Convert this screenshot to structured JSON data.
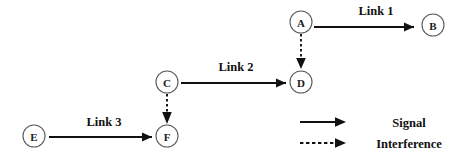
{
  "diagram": {
    "background_color": "#ffffff",
    "stroke_color": "#111111",
    "node_stroke_color": "#5a5a5a",
    "width": 463,
    "height": 157
  },
  "nodes": [
    {
      "id": "A",
      "label": "A",
      "cx": 301,
      "cy": 22,
      "r": 11
    },
    {
      "id": "B",
      "label": "B",
      "cx": 433,
      "cy": 25,
      "r": 11
    },
    {
      "id": "C",
      "label": "C",
      "cx": 167,
      "cy": 82,
      "r": 11
    },
    {
      "id": "D",
      "label": "D",
      "cx": 301,
      "cy": 82,
      "r": 11
    },
    {
      "id": "E",
      "label": "E",
      "cx": 34,
      "cy": 136,
      "r": 11
    },
    {
      "id": "F",
      "label": "F",
      "cx": 167,
      "cy": 136,
      "r": 11
    }
  ],
  "edges": [
    {
      "id": "link-1",
      "from": "A",
      "to": "B",
      "kind": "signal",
      "style": "solid",
      "label": "Link 1",
      "label_x": 376,
      "label_y": 15
    },
    {
      "id": "link-2",
      "from": "C",
      "to": "D",
      "kind": "signal",
      "style": "solid",
      "label": "Link 2",
      "label_x": 236,
      "label_y": 71
    },
    {
      "id": "link-3",
      "from": "E",
      "to": "F",
      "kind": "signal",
      "style": "solid",
      "label": "Link 3",
      "label_x": 104,
      "label_y": 126
    },
    {
      "id": "interference-a-d",
      "from": "A",
      "to": "D",
      "kind": "interference",
      "style": "dashed",
      "label": "",
      "label_x": 0,
      "label_y": 0
    },
    {
      "id": "interference-c-f",
      "from": "C",
      "to": "F",
      "kind": "interference",
      "style": "dashed",
      "label": "",
      "label_x": 0,
      "label_y": 0
    }
  ],
  "legend": {
    "items": [
      {
        "id": "signal",
        "style": "solid",
        "label": "Signal",
        "y": 122,
        "label_x": 409
      },
      {
        "id": "interference",
        "style": "dashed",
        "label": "Interference",
        "y": 143,
        "label_x": 409
      }
    ],
    "arrow_x_start": 300,
    "arrow_x_end": 346
  }
}
